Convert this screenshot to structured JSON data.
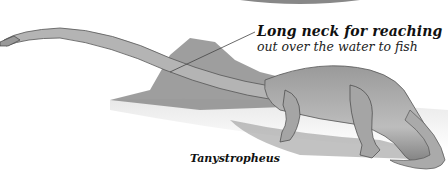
{
  "illustration": {
    "subject": "Tanystropheus",
    "callout": {
      "line1": "Long neck for reaching",
      "line2": "out over the water to fish"
    },
    "caption": "Tanystropheus"
  },
  "colors": {
    "background": "#ffffff",
    "text": "#111111",
    "rock": "#8a8a8a",
    "body": "#a8a8a8"
  }
}
